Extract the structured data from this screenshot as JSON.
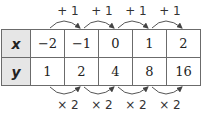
{
  "table": {
    "rows": [
      {
        "header": "x",
        "values": [
          "−2",
          "−1",
          "0",
          "1",
          "2"
        ]
      },
      {
        "header": "y",
        "values": [
          "1",
          "2",
          "4",
          "8",
          "16"
        ]
      }
    ]
  },
  "top_annotations": [
    "+ 1",
    "+ 1",
    "+ 1",
    "+ 1"
  ],
  "bottom_annotations": [
    "× 2",
    "× 2",
    "× 2",
    "× 2"
  ],
  "colors": {
    "header_bg": "#e6e6e6",
    "border": "#6b6b6b"
  }
}
